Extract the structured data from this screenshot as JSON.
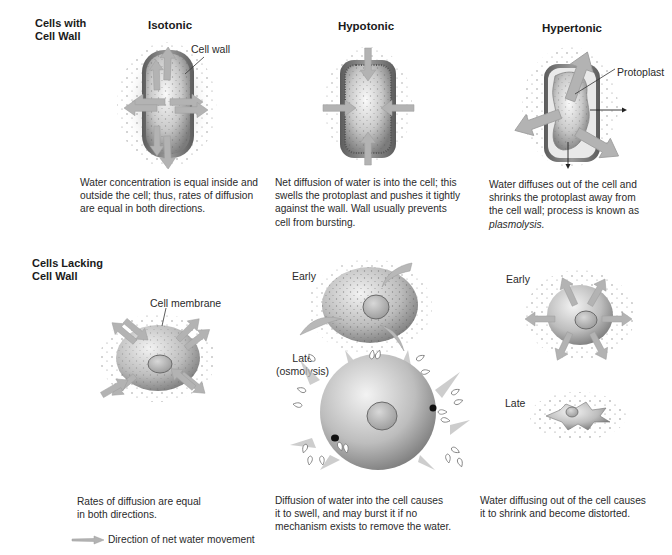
{
  "rows": {
    "with_wall": {
      "heading_line1": "Cells with",
      "heading_line2": "Cell Wall"
    },
    "lacking_wall": {
      "heading_line1": "Cells Lacking",
      "heading_line2": "Cell Wall"
    }
  },
  "columns": {
    "isotonic": "Isotonic",
    "hypotonic": "Hypotonic",
    "hypertonic": "Hypertonic"
  },
  "labels": {
    "cell_wall": "Cell wall",
    "protoplast": "Protoplast",
    "cell_membrane": "Cell membrane",
    "hypo_early": "Early",
    "hypo_late_line1": "Late",
    "hypo_late_line2": "(osmolysis)",
    "hyper_early": "Early",
    "hyper_late": "Late"
  },
  "captions": {
    "wall_isotonic": [
      "Water concentration is equal inside and",
      "outside the cell; thus, rates of diffusion",
      "are equal in both directions."
    ],
    "wall_hypotonic": [
      "Net diffusion of water is into the cell; this",
      "swells the protoplast and pushes it tightly",
      "against the wall. Wall usually prevents",
      "cell from bursting."
    ],
    "wall_hypertonic": [
      "Water diffuses out of the cell and",
      "shrinks the protoplast away from",
      "the cell wall; process is known as"
    ],
    "wall_hypertonic_term": "plasmolysis.",
    "nowall_isotonic": [
      "Rates of diffusion are equal",
      "in both directions."
    ],
    "nowall_hypotonic": [
      "Diffusion of water into the cell causes",
      "it to swell, and may burst it if no",
      "mechanism exists to remove the water."
    ],
    "nowall_hypertonic": [
      "Water diffusing out of the cell causes",
      "it to shrink and become distorted."
    ]
  },
  "legend": {
    "icon": "gray-arrow-icon",
    "text": "Direction of net water movement"
  },
  "colors": {
    "arrow": "#b5b5b5",
    "wall_dark": "#6e6e6e",
    "cytoplasm_light": "#f2f2f2",
    "cytoplasm_dark": "#8a8a8a",
    "dots": "#5a5a5a"
  }
}
